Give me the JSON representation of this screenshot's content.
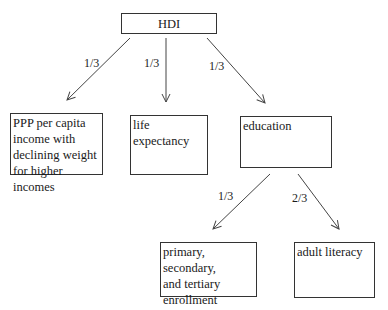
{
  "diagram": {
    "root": {
      "label": "HDI"
    },
    "nodes": [
      {
        "id": "income",
        "label": "PPP per capita income with declining weight for higher incomes",
        "lines": [
          "PPP per capita",
          "income with",
          "declining weight",
          "for higher incomes"
        ]
      },
      {
        "id": "life",
        "label": "life expectancy",
        "lines": [
          "life",
          "expectancy"
        ]
      },
      {
        "id": "education",
        "label": "education",
        "lines": [
          "education"
        ]
      },
      {
        "id": "enrollment",
        "label": "primary, secondary, and tertiary enrollment",
        "lines": [
          "primary, secondary,",
          "and tertiary",
          "enrollment"
        ]
      },
      {
        "id": "literacy",
        "label": "adult literacy",
        "lines": [
          "adult literacy"
        ]
      }
    ],
    "edges": [
      {
        "from": "HDI",
        "to": "income",
        "weight": "1/3"
      },
      {
        "from": "HDI",
        "to": "life",
        "weight": "1/3"
      },
      {
        "from": "HDI",
        "to": "education",
        "weight": "1/3"
      },
      {
        "from": "education",
        "to": "enrollment",
        "weight": "1/3"
      },
      {
        "from": "education",
        "to": "literacy",
        "weight": "2/3"
      }
    ]
  }
}
